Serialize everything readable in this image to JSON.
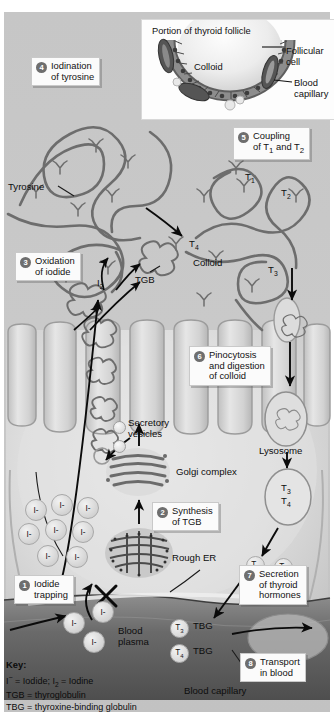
{
  "figure": {
    "background_color": "#c8c8c8",
    "callout_box_color": "#fbfbfb",
    "step_badge_color": "#6e6e6e"
  },
  "inset": {
    "title": "Portion of thyroid follicle",
    "colloid_label": "Colloid",
    "labels": [
      {
        "name": "follicular-cell",
        "line1": "Follicular",
        "line2": "cell"
      },
      {
        "name": "blood-capillary",
        "line1": "Blood",
        "line2": "capillary"
      }
    ]
  },
  "steps": [
    {
      "num": "1",
      "lines": [
        "Iodide",
        "trapping"
      ]
    },
    {
      "num": "2",
      "lines": [
        "Synthesis",
        "of TGB"
      ]
    },
    {
      "num": "3",
      "lines": [
        "Oxidation",
        "of iodide"
      ]
    },
    {
      "num": "4",
      "lines": [
        "Iodination",
        "of tyrosine"
      ]
    },
    {
      "num": "5",
      "lines": [
        "Coupling",
        "of T1 and T2"
      ]
    },
    {
      "num": "6",
      "lines": [
        "Pinocytosis",
        "and digestion",
        "of colloid"
      ]
    },
    {
      "num": "7",
      "lines": [
        "Secretion",
        "of thyroid",
        "hormones"
      ]
    },
    {
      "num": "8",
      "lines": [
        "Transport",
        "in blood"
      ]
    }
  ],
  "labels": {
    "tyrosine": "Tyrosine",
    "colloid": "Colloid",
    "tgb": "TGB",
    "i2": "I2",
    "secretory_vesicles_line1": "Secretory",
    "secretory_vesicles_line2": "vesicles",
    "golgi": "Golgi complex",
    "rough_er": "Rough ER",
    "lysosome": "Lysosome",
    "blood_plasma_line1": "Blood",
    "blood_plasma_line2": "plasma",
    "blood_capillary": "Blood capillary",
    "t1": "T1",
    "t2": "T2",
    "t3": "T3",
    "t4": "T4",
    "tbg": "TBG",
    "iodide_ion": "I-"
  },
  "molecules": {
    "colloid_t_labels": [
      "T1",
      "T2",
      "T4",
      "T3"
    ],
    "lysosome_vesicle_contents": [
      "T3",
      "T4"
    ],
    "cytosol_hormones": [
      "T3",
      "T4"
    ],
    "plasma_pairs": [
      {
        "hormone": "T3",
        "carrier": "TBG"
      },
      {
        "hormone": "T4",
        "carrier": "TBG"
      }
    ],
    "iodide_count_cytosol": 8,
    "iodide_count_plasma": 3
  },
  "key": {
    "heading": "Key:",
    "entries": [
      "I- = Iodide; I2 = Iodine",
      "TGB = thyroglobulin",
      "TBG = thyroxine-binding globulin"
    ],
    "line1_parts": {
      "a": "I",
      "a_sup": "−",
      "b": " = Iodide; I",
      "b_sub": "2",
      "c": " = Iodine"
    },
    "line2": "TGB = thyroglobulin",
    "line3": "TBG = thyroxine-binding globulin"
  }
}
